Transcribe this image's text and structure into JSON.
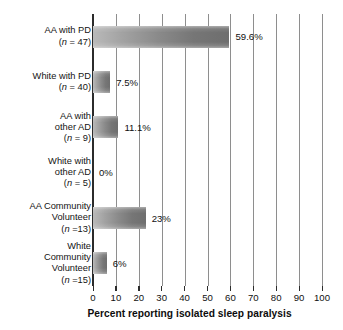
{
  "chart_data": {
    "type": "bar",
    "orientation": "horizontal",
    "title": "",
    "xlabel": "Percent reporting isolated sleep paralysis",
    "ylabel": "",
    "xlim": [
      0,
      100
    ],
    "grid": true,
    "legend": "none",
    "xticks": [
      "0",
      "10",
      "20",
      "30",
      "40",
      "50",
      "60",
      "70",
      "80",
      "90",
      "100"
    ],
    "categories": [
      "AA with PD",
      "White with PD",
      "AA with other AD",
      "White with other AD",
      "AA Community Volunteer",
      "White Community Volunteer"
    ],
    "values": [
      59.6,
      7.5,
      11.1,
      0,
      23,
      6
    ],
    "value_labels": [
      "59.6%",
      "7.5%",
      "11.1%",
      "0%",
      "23%",
      "6%"
    ],
    "group_sizes": [
      47,
      40,
      9,
      5,
      13,
      15
    ]
  },
  "rows": [
    {
      "name_lines": [
        "AA with PD"
      ],
      "n_text": "(n = 47)",
      "n_prefix": "(",
      "n_symbol": "n",
      "n_suffix": " = 47)",
      "value": 59.6,
      "value_label": "59.6%"
    },
    {
      "name_lines": [
        "White with PD"
      ],
      "n_text": "(n = 40)",
      "n_prefix": "(",
      "n_symbol": "n",
      "n_suffix": " = 40)",
      "value": 7.5,
      "value_label": "7.5%"
    },
    {
      "name_lines": [
        "AA with",
        "other AD"
      ],
      "n_text": "(n = 9)",
      "n_prefix": "(",
      "n_symbol": "n",
      "n_suffix": " = 9)",
      "value": 11.1,
      "value_label": "11.1%"
    },
    {
      "name_lines": [
        "White with",
        "other AD"
      ],
      "n_text": "(n = 5)",
      "n_prefix": "(",
      "n_symbol": "n",
      "n_suffix": " = 5)",
      "value": 0,
      "value_label": "0%"
    },
    {
      "name_lines": [
        "AA Community",
        "Volunteer"
      ],
      "n_text": "(n =13)",
      "n_prefix": "(",
      "n_symbol": "n",
      "n_suffix": " =13)",
      "value": 23,
      "value_label": "23%"
    },
    {
      "name_lines": [
        "White",
        "Community",
        "Volunteer"
      ],
      "n_text": "(n =15)",
      "n_prefix": "(",
      "n_symbol": "n",
      "n_suffix": " =15)",
      "value": 6,
      "value_label": "6%"
    }
  ],
  "axis": {
    "title": "Percent reporting isolated sleep paralysis",
    "ticks": [
      "0",
      "10",
      "20",
      "30",
      "40",
      "50",
      "60",
      "70",
      "80",
      "90",
      "100"
    ]
  },
  "colors": {
    "bar_light": "#b9b9b9",
    "bar_dark": "#6e6e6e",
    "gridline": "#8e8e8e",
    "axis": "#2b2b2b",
    "text": "#111111",
    "background": "#ffffff"
  }
}
